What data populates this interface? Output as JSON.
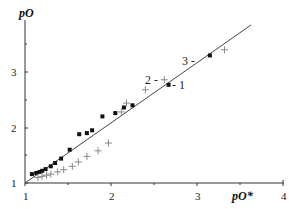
{
  "chart_data": {
    "type": "scatter",
    "title": "",
    "xlabel": "pO*",
    "ylabel": "pO",
    "xlim": [
      1,
      4
    ],
    "ylim": [
      1,
      3.9
    ],
    "xticks": [
      1,
      2,
      3,
      4
    ],
    "yticks": [
      1,
      2,
      3
    ],
    "grid": false,
    "legend": "none (series labelled by inline annotations)",
    "annotations": [
      {
        "text": "1",
        "label": "- 1"
      },
      {
        "text": "2",
        "label": "2 -"
      },
      {
        "text": "3",
        "label": "3 -"
      }
    ],
    "series": [
      {
        "name": "1",
        "marker": "square",
        "x": [
          1.08,
          1.13,
          1.17,
          1.2,
          1.24,
          1.3,
          1.35,
          1.42,
          1.52,
          1.63,
          1.72,
          1.78,
          1.9,
          2.05,
          2.15,
          2.25,
          2.67,
          3.15
        ],
        "y": [
          1.16,
          1.18,
          1.2,
          1.22,
          1.25,
          1.3,
          1.36,
          1.44,
          1.6,
          1.88,
          1.9,
          1.95,
          2.2,
          2.26,
          2.36,
          2.4,
          2.77,
          3.3
        ]
      },
      {
        "name": "2",
        "marker": "plus",
        "x": [
          1.15,
          1.2,
          1.25,
          1.3,
          1.38,
          1.45,
          1.55,
          1.62,
          1.72,
          1.85,
          1.97,
          2.12,
          2.18,
          2.4,
          2.62,
          3.32
        ],
        "y": [
          1.1,
          1.12,
          1.14,
          1.16,
          1.2,
          1.24,
          1.3,
          1.38,
          1.48,
          1.58,
          1.72,
          2.28,
          2.44,
          2.68,
          2.86,
          3.4
        ]
      },
      {
        "name": "3",
        "type": "line",
        "x": [
          1.0,
          3.64
        ],
        "y": [
          1.0,
          3.85
        ]
      }
    ]
  },
  "axes": {
    "x_title": "pO*",
    "y_title": "pO",
    "x_tick_labels": [
      "1",
      "2",
      "3",
      "4"
    ],
    "y_tick_labels": [
      "1",
      "2",
      "3"
    ]
  },
  "labels": {
    "l1": "- 1",
    "l2": "2 -",
    "l3": "3 -"
  }
}
